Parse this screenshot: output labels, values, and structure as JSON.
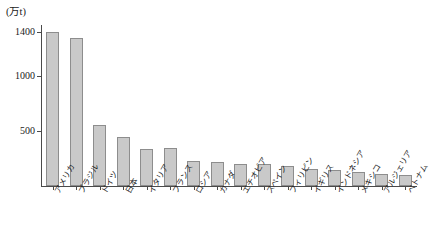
{
  "chart_data": {
    "type": "bar",
    "title": "",
    "subtitle": "",
    "unit_label": "(万t)",
    "xlabel": "",
    "ylabel": "",
    "ylim": [
      0,
      1450
    ],
    "yticks": [
      500,
      1000,
      1400
    ],
    "ytick_labels": [
      "500",
      "1000",
      "1400"
    ],
    "grid": false,
    "legend": null,
    "categories": [
      "アメリカ",
      "ブラジル",
      "ドイツ",
      "日本",
      "イタリア",
      "フランス",
      "ロシア",
      "カナダ",
      "エチオピア",
      "スペイン",
      "フィリピン",
      "イギリス",
      "インドネシア",
      "メキシコ",
      "アルジェリア",
      "ベトナム"
    ],
    "values": [
      1400,
      1350,
      560,
      450,
      340,
      345,
      225,
      215,
      205,
      200,
      185,
      155,
      150,
      125,
      110,
      105
    ],
    "bar_color": "#c9c9c9",
    "bar_border_color": "#8d8d8d",
    "axis_color": "#4a4a4a"
  }
}
